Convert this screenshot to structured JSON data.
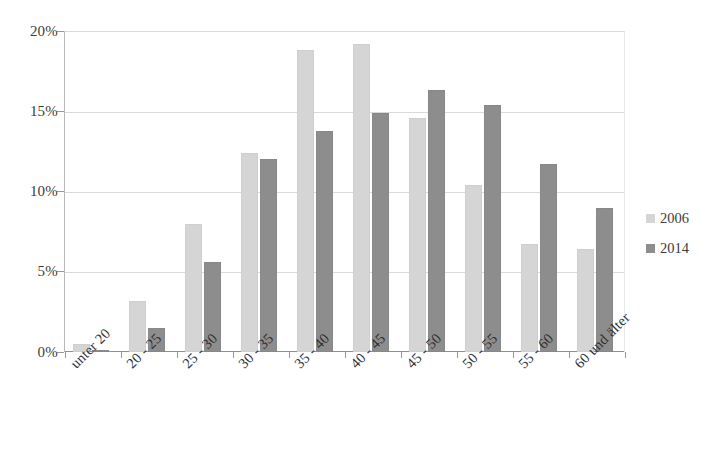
{
  "chart_data": {
    "type": "bar",
    "title": "",
    "subtitle": "",
    "xlabel": "",
    "ylabel": "",
    "categories": [
      "unter 20",
      "20 - 25",
      "25 - 30",
      "30 - 35",
      "35 - 40",
      "40 - 45",
      "45 - 50",
      "50 - 55",
      "55 - 60",
      "60 und älter"
    ],
    "series": [
      {
        "name": "2006",
        "color": "#d5d5d5",
        "values": [
          0.5,
          3.2,
          8.0,
          12.4,
          18.8,
          19.2,
          14.6,
          10.4,
          6.7,
          6.4
        ]
      },
      {
        "name": "2014",
        "color": "#8d8d8d",
        "values": [
          0.15,
          1.5,
          5.6,
          12.0,
          13.8,
          14.9,
          16.3,
          15.4,
          11.7,
          9.0
        ]
      }
    ],
    "ylim": [
      0,
      20
    ],
    "ytick_values": [
      0,
      5,
      10,
      15,
      20
    ],
    "ytick_labels": [
      "0%",
      "5%",
      "10%",
      "15%",
      "20%"
    ],
    "value_unit": "%",
    "grid": true,
    "legend_position": "right"
  },
  "legend": {
    "entries": [
      {
        "label": "2006",
        "color": "#d5d5d5"
      },
      {
        "label": "2014",
        "color": "#8d8d8d"
      }
    ]
  },
  "axis": {
    "y_labels": [
      "20%",
      "15%",
      "10%",
      "5%",
      "0%"
    ]
  }
}
